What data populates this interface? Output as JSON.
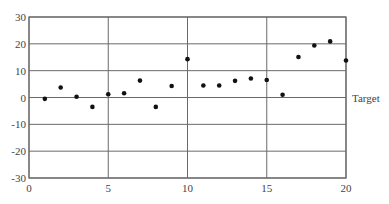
{
  "chart_data": {
    "type": "scatter",
    "title": "",
    "xlabel": "",
    "ylabel": "",
    "xlim": [
      0,
      20
    ],
    "ylim": [
      -30,
      30
    ],
    "x_ticks": [
      0,
      5,
      10,
      15,
      20
    ],
    "y_ticks": [
      30,
      20,
      10,
      0,
      -10,
      -20,
      -30
    ],
    "grid": true,
    "legend": null,
    "annotations": [
      {
        "text": "Target",
        "y": 0,
        "position": "right of plot at y=0"
      }
    ],
    "series": [
      {
        "name": "observations",
        "x": [
          1,
          2,
          3,
          4,
          5,
          6,
          7,
          8,
          9,
          10,
          11,
          12,
          13,
          14,
          15,
          16,
          17,
          18,
          19,
          20
        ],
        "y": [
          -0.5,
          3.7,
          0.3,
          -3.5,
          1.2,
          1.6,
          6.3,
          -3.5,
          4.3,
          14.3,
          4.5,
          4.5,
          6.2,
          7.1,
          6.5,
          1.0,
          15.1,
          19.4,
          20.9,
          13.8
        ]
      }
    ]
  },
  "labels": {
    "target": "Target"
  },
  "colors": {
    "grid": "#6a6a6a",
    "frame": "#6a6a6a",
    "point": "#111111",
    "text": "#444444"
  }
}
